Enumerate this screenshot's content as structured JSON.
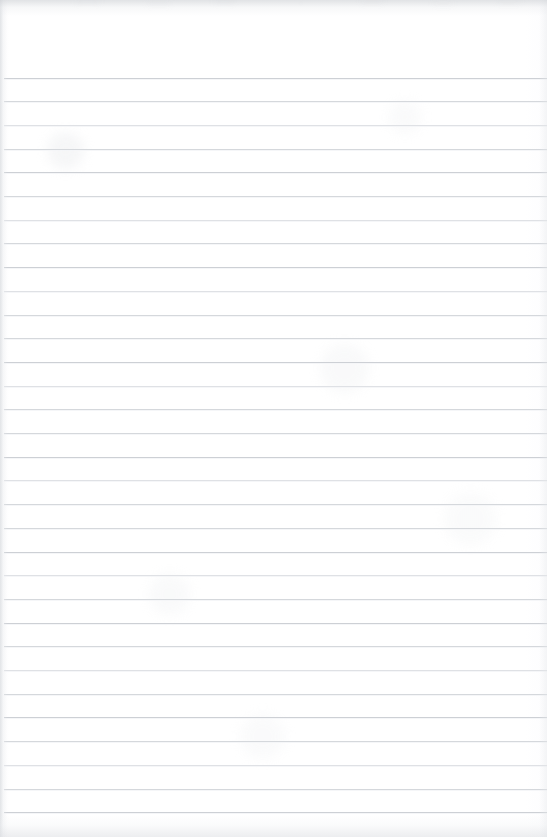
{
  "document": {
    "kind": "scanned-lined-notepad-page",
    "title": "Blank lined paper",
    "page_width": 547,
    "page_height": 837,
    "content_text": "",
    "is_blank": true
  },
  "paper": {
    "background_color": "#ffffff",
    "rule_color": "#d5d8dc",
    "rule_color_light": "#dfe1e5",
    "rule_color_dark": "#cdd0d5",
    "edge_shadow_color": "#ced1d5",
    "header_margin_height": 76,
    "rule_spacing": 23.7,
    "rule_left": 4,
    "rule_right": 547,
    "first_rule_y": 77.5,
    "rule_count": 32
  },
  "rules": [
    {
      "y": 77.5,
      "tone": "dark"
    },
    {
      "y": 101.2,
      "tone": "normal"
    },
    {
      "y": 124.9,
      "tone": "light"
    },
    {
      "y": 148.6,
      "tone": "normal"
    },
    {
      "y": 172.3,
      "tone": "dark"
    },
    {
      "y": 196.0,
      "tone": "normal"
    },
    {
      "y": 219.7,
      "tone": "light"
    },
    {
      "y": 243.4,
      "tone": "normal"
    },
    {
      "y": 267.1,
      "tone": "dark"
    },
    {
      "y": 290.8,
      "tone": "light"
    },
    {
      "y": 314.5,
      "tone": "normal"
    },
    {
      "y": 338.2,
      "tone": "normal"
    },
    {
      "y": 361.9,
      "tone": "dark"
    },
    {
      "y": 385.6,
      "tone": "light"
    },
    {
      "y": 409.3,
      "tone": "normal"
    },
    {
      "y": 433.0,
      "tone": "normal"
    },
    {
      "y": 456.7,
      "tone": "dark"
    },
    {
      "y": 480.4,
      "tone": "light"
    },
    {
      "y": 504.1,
      "tone": "normal"
    },
    {
      "y": 527.8,
      "tone": "normal"
    },
    {
      "y": 551.5,
      "tone": "dark"
    },
    {
      "y": 575.2,
      "tone": "light"
    },
    {
      "y": 598.9,
      "tone": "normal"
    },
    {
      "y": 622.6,
      "tone": "dark"
    },
    {
      "y": 646.3,
      "tone": "normal"
    },
    {
      "y": 670.0,
      "tone": "light"
    },
    {
      "y": 693.7,
      "tone": "normal"
    },
    {
      "y": 717.4,
      "tone": "dark"
    },
    {
      "y": 741.1,
      "tone": "normal"
    },
    {
      "y": 764.8,
      "tone": "light"
    },
    {
      "y": 788.5,
      "tone": "normal"
    },
    {
      "y": 812.2,
      "tone": "dark"
    }
  ]
}
